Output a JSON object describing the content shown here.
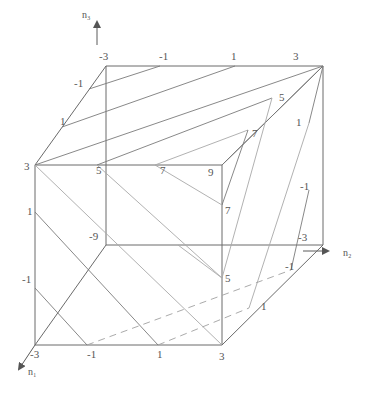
{
  "axes": {
    "n1": "n₁",
    "n2": "n₂",
    "n3": "n₃"
  },
  "labels": {
    "top_edge": [
      "-3",
      "-1",
      "1",
      "3"
    ],
    "top_left_edge": [
      "-1",
      "1"
    ],
    "front_top_left": "3",
    "front_top_5": "5",
    "front_top_7": "7",
    "front_top_9": "9",
    "diag_5": "5",
    "diag_7": "7",
    "right_edge": [
      "1",
      "-1",
      "-3"
    ],
    "right_face_7": "7",
    "right_face_5": "5",
    "left_edge": [
      "1",
      "-1"
    ],
    "back_corner": "-9",
    "bottom_edge": [
      "-3",
      "-1",
      "1",
      "3"
    ],
    "bottom_right_diag": [
      "1",
      "-1"
    ]
  }
}
